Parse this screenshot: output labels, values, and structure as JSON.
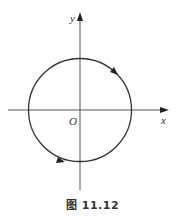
{
  "figure": {
    "caption": "图 11.12",
    "labels": {
      "y_axis": "y",
      "x_axis": "x",
      "origin": "O"
    },
    "colors": {
      "stroke": "#333333",
      "axis": "#555555",
      "background": "#ffffff"
    },
    "elements": {
      "curve": "circle centered at origin",
      "orientation": "clockwise",
      "arrows": [
        "upper-right arc pointing down-right",
        "lower-left arc pointing right"
      ]
    }
  }
}
